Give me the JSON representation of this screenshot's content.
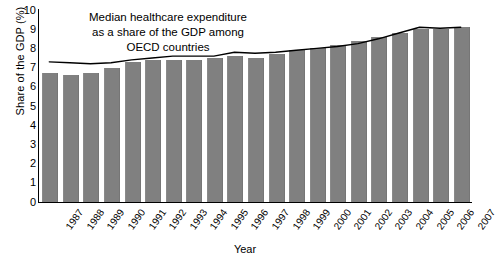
{
  "chart_data": {
    "type": "bar",
    "title": "Median healthcare expenditure as a share of the GDP among OECD countries",
    "annotation_lines": [
      "Median healthcare expenditure",
      "as a share of the GDP among",
      "OECD countries"
    ],
    "xlabel": "Year",
    "ylabel": "Share of the GDP (%)",
    "ylim": [
      0,
      10
    ],
    "yticks": [
      10,
      9,
      8,
      7,
      6,
      5,
      4,
      3,
      2,
      1,
      0
    ],
    "grid": false,
    "legend": "none",
    "categories": [
      "1987",
      "1988",
      "1989",
      "1990",
      "1991",
      "1992",
      "1993",
      "1994",
      "1995",
      "1996",
      "1997",
      "1998",
      "1999",
      "2000",
      "2001",
      "2002",
      "2003",
      "2004",
      "2005",
      "2006",
      "2007"
    ],
    "series": [
      {
        "name": "Median healthcare expenditure (share of GDP)",
        "type": "bar",
        "color": "#808080",
        "values": [
          6.7,
          6.6,
          6.7,
          7.0,
          7.3,
          7.4,
          7.4,
          7.4,
          7.5,
          7.6,
          7.5,
          7.7,
          7.9,
          8.0,
          8.2,
          8.4,
          8.6,
          8.8,
          9.0,
          9.0,
          9.1
        ]
      },
      {
        "name": "Trend line",
        "type": "line",
        "color": "#000000",
        "values": [
          7.3,
          7.25,
          7.2,
          7.25,
          7.4,
          7.5,
          7.6,
          7.6,
          7.6,
          7.8,
          7.75,
          7.8,
          7.9,
          8.0,
          8.1,
          8.25,
          8.5,
          8.8,
          9.1,
          9.05,
          9.1
        ]
      }
    ]
  },
  "colors": {
    "bar": "#808080",
    "line": "#000000",
    "axis": "#000000",
    "background": "#ffffff"
  }
}
